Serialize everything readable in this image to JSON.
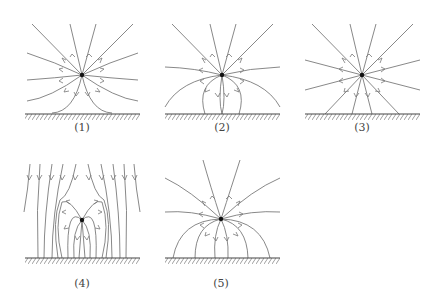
{
  "colors": {
    "line": "#7a7a7a",
    "ground": "#444444",
    "charge": "#111111",
    "background": "#ffffff"
  },
  "panels": [
    {
      "id": 1,
      "label": "(1)",
      "charge": {
        "x": 82,
        "y": 75,
        "sign": "positive"
      },
      "ground": {
        "x1": 25,
        "x2": 140,
        "y": 114
      },
      "label_pos": {
        "x": 82,
        "y": 122
      }
    },
    {
      "id": 2,
      "label": "(2)",
      "charge": {
        "x": 222,
        "y": 75,
        "sign": "positive"
      },
      "ground": {
        "x1": 165,
        "x2": 280,
        "y": 114
      },
      "label_pos": {
        "x": 222,
        "y": 122
      }
    },
    {
      "id": 3,
      "label": "(3)",
      "charge": {
        "x": 362,
        "y": 75,
        "sign": "positive"
      },
      "ground": {
        "x1": 305,
        "x2": 420,
        "y": 114
      },
      "label_pos": {
        "x": 362,
        "y": 122
      }
    },
    {
      "id": 4,
      "label": "(4)",
      "charge": {
        "x": 82,
        "y": 220,
        "sign": "positive"
      },
      "ground": {
        "x1": 25,
        "x2": 140,
        "y": 258
      },
      "label_pos": {
        "x": 82,
        "y": 278
      }
    },
    {
      "id": 5,
      "label": "(5)",
      "charge": {
        "x": 221,
        "y": 219,
        "sign": "positive"
      },
      "ground": {
        "x1": 165,
        "x2": 280,
        "y": 258
      },
      "label_pos": {
        "x": 221,
        "y": 278
      }
    }
  ]
}
